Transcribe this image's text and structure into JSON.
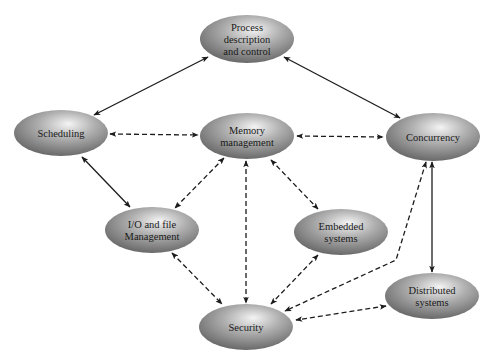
{
  "diagram": {
    "type": "os-concepts-relationship",
    "nodes": [
      {
        "id": "process",
        "label_lines": [
          "Process",
          "description",
          "and control"
        ],
        "cx": 247,
        "cy": 39,
        "rx": 47,
        "ry": 24
      },
      {
        "id": "scheduling",
        "label_lines": [
          "Scheduling"
        ],
        "cx": 61,
        "cy": 133,
        "rx": 47,
        "ry": 23
      },
      {
        "id": "memory",
        "label_lines": [
          "Memory",
          "management"
        ],
        "cx": 247,
        "cy": 136,
        "rx": 47,
        "ry": 23
      },
      {
        "id": "concurrency",
        "label_lines": [
          "Concurrency"
        ],
        "cx": 433,
        "cy": 137,
        "rx": 47,
        "ry": 24
      },
      {
        "id": "io",
        "label_lines": [
          "I/O and file",
          "Management"
        ],
        "cx": 152,
        "cy": 230,
        "rx": 47,
        "ry": 23
      },
      {
        "id": "embedded",
        "label_lines": [
          "Embedded",
          "systems"
        ],
        "cx": 341,
        "cy": 232,
        "rx": 47,
        "ry": 23
      },
      {
        "id": "distributed",
        "label_lines": [
          "Distributed",
          "systems"
        ],
        "cx": 432,
        "cy": 296,
        "rx": 47,
        "ry": 23
      },
      {
        "id": "security",
        "label_lines": [
          "Security"
        ],
        "cx": 246,
        "cy": 327,
        "rx": 47,
        "ry": 23
      }
    ],
    "edges": [
      {
        "from": "process",
        "to": "scheduling",
        "style": "solid",
        "bidirectional": true,
        "points": [
          [
            208,
            57
          ],
          [
            94,
            115
          ]
        ]
      },
      {
        "from": "process",
        "to": "concurrency",
        "style": "solid",
        "bidirectional": true,
        "points": [
          [
            284,
            57
          ],
          [
            400,
            118
          ]
        ]
      },
      {
        "from": "scheduling",
        "to": "memory",
        "style": "dashed",
        "bidirectional": true,
        "points": [
          [
            110,
            134
          ],
          [
            198,
            135
          ]
        ]
      },
      {
        "from": "memory",
        "to": "concurrency",
        "style": "dashed",
        "bidirectional": true,
        "points": [
          [
            297,
            136
          ],
          [
            383,
            137
          ]
        ]
      },
      {
        "from": "scheduling",
        "to": "io",
        "style": "solid",
        "bidirectional": true,
        "points": [
          [
            82,
            157
          ],
          [
            130,
            207
          ]
        ]
      },
      {
        "from": "memory",
        "to": "io",
        "style": "dashed",
        "bidirectional": true,
        "points": [
          [
            224,
            158
          ],
          [
            175,
            208
          ]
        ]
      },
      {
        "from": "memory",
        "to": "security",
        "style": "dashed",
        "bidirectional": true,
        "points": [
          [
            246,
            161
          ],
          [
            246,
            303
          ]
        ]
      },
      {
        "from": "memory",
        "to": "embedded",
        "style": "dashed",
        "bidirectional": true,
        "points": [
          [
            271,
            160
          ],
          [
            318,
            209
          ]
        ]
      },
      {
        "from": "io",
        "to": "security",
        "style": "dashed",
        "bidirectional": true,
        "points": [
          [
            172,
            253
          ],
          [
            222,
            304
          ]
        ]
      },
      {
        "from": "embedded",
        "to": "security",
        "style": "dashed",
        "bidirectional": true,
        "points": [
          [
            318,
            255
          ],
          [
            271,
            304
          ]
        ]
      },
      {
        "from": "concurrency",
        "to": "security",
        "style": "dashed",
        "bidirectional": true,
        "points": [
          [
            426,
            162
          ],
          [
            396,
            260
          ],
          [
            285,
            311
          ]
        ]
      },
      {
        "from": "concurrency",
        "to": "distributed",
        "style": "solid",
        "bidirectional": true,
        "points": [
          [
            432,
            162
          ],
          [
            432,
            272
          ]
        ]
      },
      {
        "from": "distributed",
        "to": "security",
        "style": "dashed",
        "bidirectional": true,
        "points": [
          [
            386,
            306
          ],
          [
            296,
            320
          ]
        ]
      }
    ],
    "colors": {
      "node_fill_center": "#f2f2f2",
      "node_fill_mid": "#a8a8a8",
      "node_fill_edge": "#6e6e6e",
      "edge_color": "#1c1c1c",
      "background": "#ffffff"
    }
  }
}
